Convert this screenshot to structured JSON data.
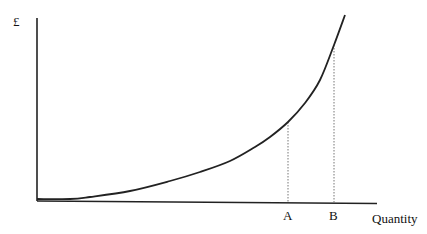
{
  "chart_data": {
    "type": "line",
    "title": "",
    "xlabel": "Quantity",
    "ylabel": "£",
    "grid": false,
    "legend": null,
    "series": [
      {
        "name": "cost curve",
        "points_px": [
          [
            37,
            199
          ],
          [
            70,
            199
          ],
          [
            90,
            197
          ],
          [
            130,
            191
          ],
          [
            170,
            181
          ],
          [
            200,
            172
          ],
          [
            230,
            161
          ],
          [
            255,
            147
          ],
          [
            270,
            137
          ],
          [
            288,
            122
          ],
          [
            305,
            103
          ],
          [
            320,
            80
          ],
          [
            334,
            45
          ],
          [
            345,
            15
          ]
        ]
      }
    ],
    "markers": [
      {
        "label": "A",
        "x_px": 288,
        "y_top_px": 122,
        "style": "dotted"
      },
      {
        "label": "B",
        "x_px": 334,
        "y_top_px": 45,
        "style": "dotted"
      }
    ],
    "annotations": [
      "A",
      "B"
    ]
  },
  "labels": {
    "y_axis": "£",
    "x_axis": "Quantity",
    "marker_a": "A",
    "marker_b": "B"
  }
}
